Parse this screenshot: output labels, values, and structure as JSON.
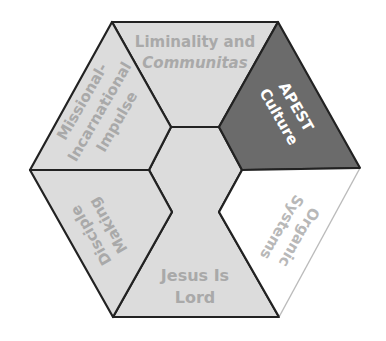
{
  "colors": {
    "light_fill": "#dcdcdc",
    "dark_fill": "#6b6b6b",
    "white_fill": "#ffffff",
    "stroke": "#222222",
    "light_stroke": "#bbbbbb",
    "light_text": "#a9a9a9",
    "dark_text": "#ffffff"
  },
  "segments": {
    "liminality": {
      "line1": "Liminality and",
      "line2": "Communitas"
    },
    "apest": {
      "line1": "APEST",
      "line2": "Culture"
    },
    "organic": {
      "line1": "Organic",
      "line2": "Systems"
    },
    "jesus": {
      "line1": "Jesus Is",
      "line2": "Lord"
    },
    "disciple": {
      "line1": "Disciple",
      "line2": "Making"
    },
    "missional": {
      "line1": "Missional-",
      "line2": "Incarnational",
      "line3": "Impulse"
    }
  }
}
